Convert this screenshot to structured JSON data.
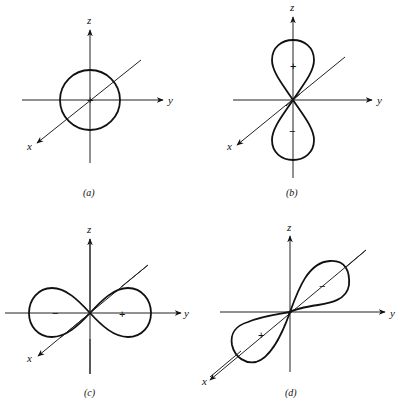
{
  "figure": {
    "type": "orbital-diagram",
    "panels": [
      {
        "id": "a",
        "caption": "(a)",
        "shape": "sphere",
        "axes": {
          "z": "z",
          "y": "y",
          "x": "x"
        },
        "signs": [
          "+"
        ]
      },
      {
        "id": "b",
        "caption": "(b)",
        "shape": "dumbbell-along-z",
        "axes": {
          "z": "z",
          "y": "y",
          "x": "x"
        },
        "signs": [
          "+",
          "−"
        ]
      },
      {
        "id": "c",
        "caption": "(c)",
        "shape": "dumbbell-along-y",
        "axes": {
          "z": "z",
          "y": "y",
          "x": "x"
        },
        "signs": [
          "−",
          "+"
        ]
      },
      {
        "id": "d",
        "caption": "(d)",
        "shape": "dumbbell-along-x",
        "axes": {
          "z": "z",
          "y": "y",
          "x": "x"
        },
        "signs": [
          "−",
          "+"
        ]
      }
    ]
  }
}
